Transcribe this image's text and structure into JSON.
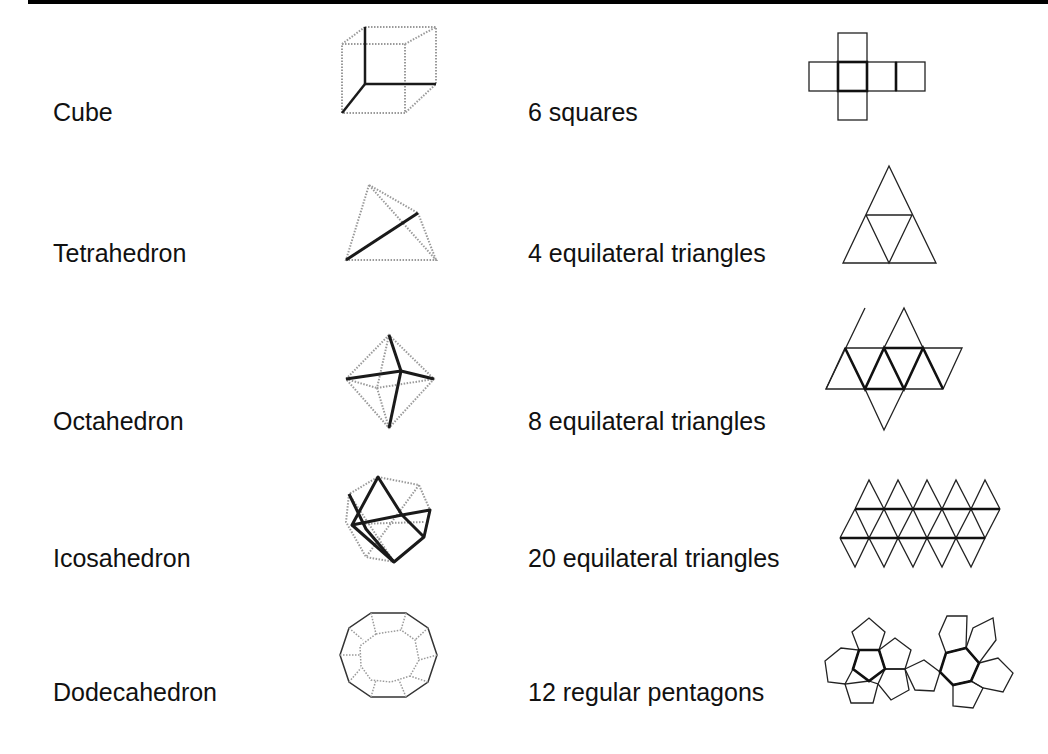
{
  "rows": [
    {
      "solid": "Cube",
      "net_description": "6 squares"
    },
    {
      "solid": "Tetrahedron",
      "net_description": "4 equilateral triangles"
    },
    {
      "solid": "Octahedron",
      "net_description": "8 equilateral triangles"
    },
    {
      "solid": "Icosahedron",
      "net_description": "20 equilateral triangles"
    },
    {
      "solid": "Dodecahedron",
      "net_description": "12 regular pentagons"
    }
  ],
  "colors": {
    "background": "#ffffff",
    "line": "#1a1a1a",
    "hidden_edge": "#9a9a9a",
    "top_rule": "#000000"
  }
}
